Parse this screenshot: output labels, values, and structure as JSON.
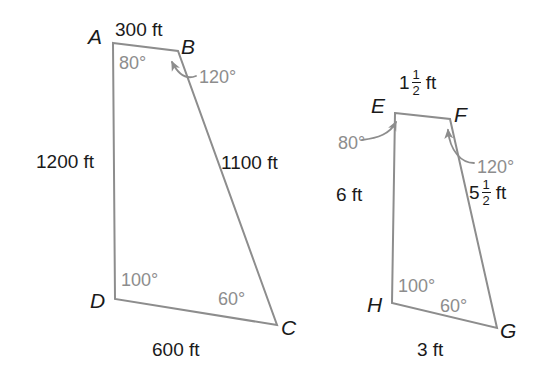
{
  "figure": {
    "stroke_color": "#8d8d8d",
    "angle_text_color": "#8d8d8d",
    "side_text_color": "#1a1a1a",
    "vertex_text_color": "#1a1a1a",
    "background": "#ffffff"
  },
  "shapes": [
    {
      "name": "quadrilateral-abcd",
      "vertices": [
        {
          "label": "A",
          "x": 113,
          "y": 43,
          "label_x": 88,
          "label_y": 26
        },
        {
          "label": "B",
          "x": 178,
          "y": 51,
          "label_x": 181,
          "label_y": 36
        },
        {
          "label": "C",
          "x": 277,
          "y": 325,
          "label_x": 281,
          "label_y": 317
        },
        {
          "label": "D",
          "x": 115,
          "y": 299,
          "label_x": 90,
          "label_y": 290
        }
      ],
      "sides": [
        {
          "name": "side-ab",
          "text": "300 ft",
          "x": 115,
          "y": 20,
          "align": "left"
        },
        {
          "name": "side-bc",
          "text": "1100 ft",
          "x": 221,
          "y": 153,
          "align": "left"
        },
        {
          "name": "side-cd",
          "text": "600 ft",
          "x": 152,
          "y": 340,
          "align": "left"
        },
        {
          "name": "side-da",
          "text": "1200 ft",
          "x": 36,
          "y": 152,
          "align": "left"
        }
      ],
      "angles": [
        {
          "name": "angle-a",
          "text": "80°",
          "x": 119,
          "y": 54,
          "arrow": false
        },
        {
          "name": "angle-b",
          "text": "120°",
          "x": 199,
          "y": 68,
          "arrow": true
        },
        {
          "name": "angle-c",
          "text": "60°",
          "x": 218,
          "y": 290,
          "arrow": false
        },
        {
          "name": "angle-d",
          "text": "100°",
          "x": 121,
          "y": 271,
          "arrow": false
        }
      ]
    },
    {
      "name": "quadrilateral-efgh",
      "vertices": [
        {
          "label": "E",
          "x": 395,
          "y": 113,
          "label_x": 371,
          "label_y": 95
        },
        {
          "label": "F",
          "x": 450,
          "y": 119,
          "label_x": 454,
          "label_y": 104
        },
        {
          "label": "G",
          "x": 497,
          "y": 328,
          "label_x": 500,
          "label_y": 320
        },
        {
          "label": "H",
          "x": 392,
          "y": 303,
          "label_x": 367,
          "label_y": 294
        }
      ],
      "sides": [
        {
          "name": "side-ef",
          "mixed": {
            "whole": "1",
            "num": "1",
            "den": "2",
            "unit": "ft"
          },
          "x": 399,
          "y": 72
        },
        {
          "name": "side-fg",
          "mixed": {
            "whole": "5",
            "num": "1",
            "den": "2",
            "unit": "ft"
          },
          "x": 469,
          "y": 182
        },
        {
          "name": "side-gh",
          "text": "3 ft",
          "x": 417,
          "y": 340
        },
        {
          "name": "side-he",
          "text": "6 ft",
          "x": 336,
          "y": 185
        }
      ],
      "angles": [
        {
          "name": "angle-e",
          "text": "80°",
          "x": 338,
          "y": 134,
          "arrow": true
        },
        {
          "name": "angle-f",
          "text": "120°",
          "x": 477,
          "y": 158,
          "arrow": true
        },
        {
          "name": "angle-g",
          "text": "60°",
          "x": 440,
          "y": 297,
          "arrow": false
        },
        {
          "name": "angle-h",
          "text": "100°",
          "x": 398,
          "y": 277,
          "arrow": false
        }
      ]
    }
  ]
}
